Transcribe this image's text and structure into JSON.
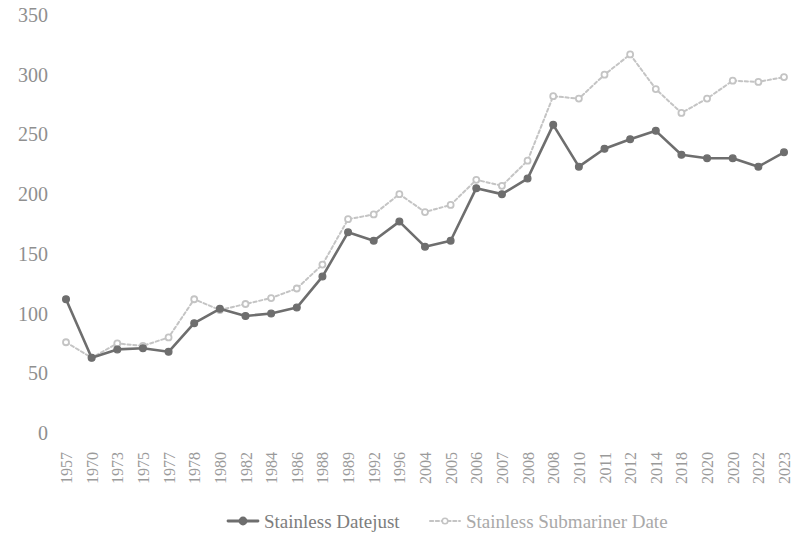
{
  "chart_data": {
    "type": "line",
    "title": "",
    "subtitle": "",
    "xlabel": "",
    "ylabel": "",
    "ylim": [
      0,
      350
    ],
    "ytick_values": [
      0,
      50,
      100,
      150,
      200,
      250,
      300,
      350
    ],
    "ytick_labels": [
      "0",
      "50",
      "100",
      "150",
      "200",
      "250",
      "300",
      "350"
    ],
    "grid": false,
    "legend_position": "bottom",
    "categories": [
      "1957",
      "1970",
      "1973",
      "1975",
      "1977",
      "1978",
      "1980",
      "1982",
      "1984",
      "1986",
      "1988",
      "1989",
      "1992",
      "1996",
      "2004",
      "2005",
      "2006",
      "2007",
      "2008",
      "2008",
      "2010",
      "2011",
      "2012",
      "2014",
      "2018",
      "2020",
      "2020",
      "2022",
      "2023"
    ],
    "series": [
      {
        "name": "Stainless Datejust",
        "color": "#6e6e6e",
        "marker": "filled-circle",
        "line_style": "solid",
        "values": [
          112,
          63,
          70,
          71,
          68,
          92,
          104,
          98,
          100,
          105,
          131,
          168,
          161,
          177,
          156,
          161,
          205,
          200,
          213,
          258,
          223,
          238,
          246,
          253,
          233,
          230,
          230,
          223,
          235
        ]
      },
      {
        "name": "Stainless Submariner Date",
        "color": "#c4c4c4",
        "marker": "open-circle",
        "line_style": "dotted",
        "values": [
          76,
          63,
          75,
          73,
          80,
          112,
          103,
          108,
          113,
          121,
          141,
          179,
          183,
          200,
          185,
          191,
          212,
          207,
          228,
          282,
          280,
          300,
          317,
          288,
          268,
          280,
          295,
          294,
          298
        ]
      }
    ]
  },
  "legend": {
    "items": [
      {
        "label": "Stainless Datejust",
        "color": "#6e6e6e",
        "style": "solid"
      },
      {
        "label": "Stainless Submariner Date",
        "color": "#c4c4c4",
        "style": "dotted"
      }
    ]
  },
  "colors": {
    "datejust": "#6e6e6e",
    "submariner": "#c4c4c4",
    "axis_text": "#8f8f8f",
    "background": "#ffffff"
  }
}
